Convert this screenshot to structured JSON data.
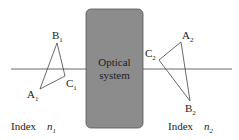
{
  "diagram": {
    "colors": {
      "box_fill": "#8c8c8c",
      "box_stroke": "#555555",
      "line": "#444444"
    },
    "box": {
      "line1": "Optical",
      "line2": "system"
    },
    "object": {
      "points": {
        "A": "A",
        "B": "B",
        "C": "C"
      },
      "subscript": "1",
      "index_label": "Index",
      "index_symbol": "n",
      "index_sub": "1"
    },
    "image": {
      "points": {
        "A": "A",
        "B": "B",
        "C": "C"
      },
      "subscript": "2",
      "index_label": "Index",
      "index_symbol": "n",
      "index_sub": "2"
    }
  }
}
